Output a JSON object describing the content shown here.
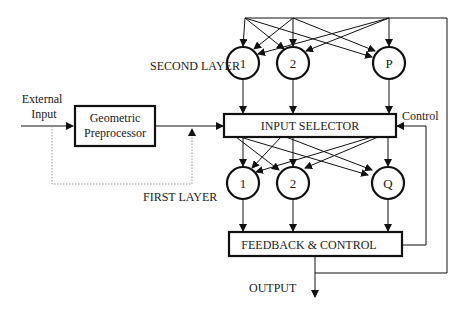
{
  "labels": {
    "second_layer": "SECOND LAYER",
    "first_layer": "FIRST LAYER",
    "external_input_line1": "External",
    "external_input_line2": "Input",
    "control": "Control",
    "output": "OUTPUT"
  },
  "blocks": {
    "preprocessor_line1": "Geometric",
    "preprocessor_line2": "Preprocessor",
    "input_selector": "INPUT SELECTOR",
    "feedback_control": "FEEDBACK & CONTROL"
  },
  "second_layer_nodes": [
    "1",
    "2",
    "P"
  ],
  "first_layer_nodes": [
    "1",
    "2",
    "Q"
  ],
  "colors": {
    "stroke": "#111111",
    "dotted": "#999999"
  }
}
